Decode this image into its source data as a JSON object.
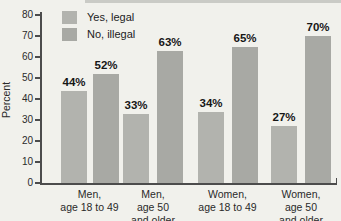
{
  "chart_data": {
    "type": "bar",
    "title": "",
    "xlabel": "",
    "ylabel": "Percent",
    "ylim": [
      0,
      80
    ],
    "yticks": [
      0,
      10,
      20,
      30,
      40,
      50,
      60,
      70,
      80
    ],
    "grid": false,
    "legend_position": "top-left-inside",
    "value_label_suffix": "%",
    "categories": [
      [
        "Men,",
        "age 18 to 49"
      ],
      [
        "Men,",
        "age 50",
        "and older"
      ],
      [
        "Women,",
        "age 18 to 49"
      ],
      [
        "Women,",
        "age 50",
        "and older"
      ]
    ],
    "series": [
      {
        "name": "Yes, legal",
        "values": [
          44,
          33,
          34,
          27
        ],
        "color": "#b2b3ae"
      },
      {
        "name": "No, illegal",
        "values": [
          52,
          63,
          65,
          70
        ],
        "color": "#a8a9a4"
      }
    ]
  },
  "colors": {
    "background": "#f1f1ec",
    "axis": "#4c4c4c",
    "text": "#2a2a2a",
    "value_label": "#161616"
  }
}
